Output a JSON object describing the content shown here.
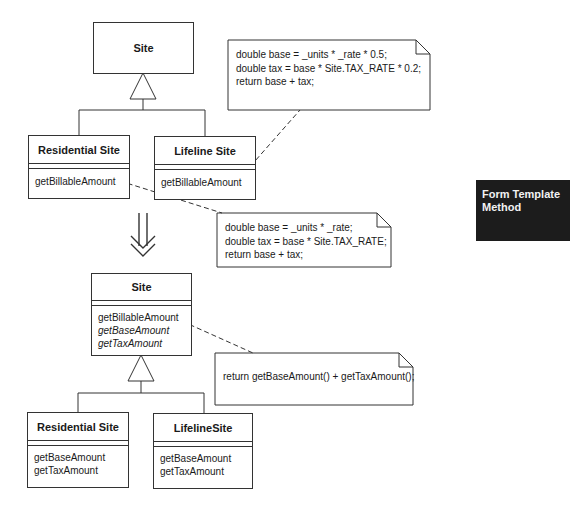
{
  "before": {
    "superclass": {
      "name": "Site"
    },
    "subclasses": [
      {
        "name": "Residential Site",
        "operations": [
          {
            "name": "getBillableAmount",
            "abstract": false
          }
        ]
      },
      {
        "name": "Lifeline Site",
        "operations": [
          {
            "name": "getBillableAmount",
            "abstract": false
          }
        ]
      }
    ],
    "notes": [
      {
        "lines": [
          "double base = _units * _rate * 0.5;",
          "double tax = base * Site.TAX_RATE * 0.2;",
          "return base + tax;"
        ]
      },
      {
        "lines": [
          "double base = _units * _rate;",
          "double tax = base * Site.TAX_RATE;",
          "return base + tax;"
        ]
      }
    ]
  },
  "transform_arrow": {
    "icon": "double-down-arrow-icon"
  },
  "after": {
    "superclass": {
      "name": "Site",
      "operations": [
        {
          "name": "getBillableAmount",
          "abstract": false
        },
        {
          "name": "getBaseAmount",
          "abstract": true
        },
        {
          "name": "getTaxAmount",
          "abstract": true
        }
      ]
    },
    "subclasses": [
      {
        "name": "Residential Site",
        "operations": [
          {
            "name": "getBaseAmount"
          },
          {
            "name": "getTaxAmount"
          }
        ]
      },
      {
        "name": "LifelineSite",
        "operations": [
          {
            "name": "getBaseAmount"
          },
          {
            "name": "getTaxAmount"
          }
        ]
      }
    ],
    "notes": [
      {
        "lines": [
          "return getBaseAmount() + getTaxAmount();"
        ]
      }
    ]
  },
  "tag": {
    "title_line1": "Form Template",
    "title_line2": "Method",
    "background": "#1c1c1c"
  }
}
